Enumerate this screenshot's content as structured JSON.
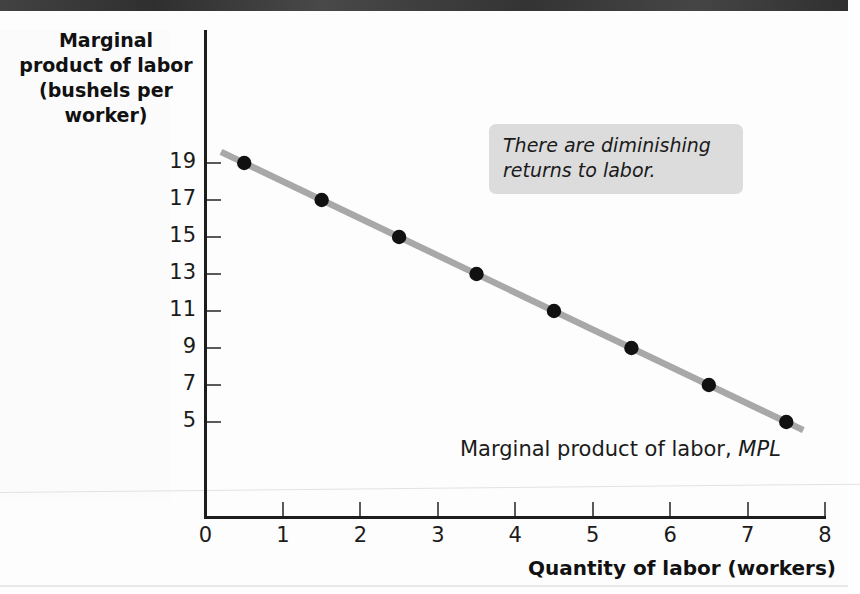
{
  "chart_data": {
    "type": "line",
    "title": "",
    "xlabel": "Quantity of labor (workers)",
    "ylabel": "Marginal product of labor (bushels per worker)",
    "ylabel_lines": [
      "Marginal",
      "product of labor",
      "(bushels per",
      "worker)"
    ],
    "xlim": [
      0,
      8
    ],
    "ylim": [
      4,
      20
    ],
    "grid": false,
    "legend": "none",
    "x_ticks": [
      "0",
      "1",
      "2",
      "3",
      "4",
      "5",
      "6",
      "7",
      "8"
    ],
    "y_ticks": [
      "19",
      "17",
      "15",
      "13",
      "11",
      "9",
      "7",
      "5"
    ],
    "series": [
      {
        "name": "Marginal product of labor, MPL",
        "x": [
          0.5,
          1.5,
          2.5,
          3.5,
          4.5,
          5.5,
          6.5,
          7.5
        ],
        "values": [
          19,
          17,
          15,
          13,
          11,
          9,
          7,
          5
        ],
        "line_color": "#a8a8a8",
        "marker_color": "#111111"
      }
    ],
    "annotations": [
      {
        "text": "There are diminishing returns to labor.",
        "style": "italic-callout-box"
      }
    ]
  },
  "axis": {
    "x_title": "Quantity of labor (workers)",
    "y_title_line_1": "Marginal",
    "y_title_line_2": "product of labor",
    "y_title_line_3": "(bushels per",
    "y_title_line_4": "worker)"
  },
  "annotation": {
    "line_1": "There are diminishing",
    "line_2": "returns to labor."
  },
  "series_label": {
    "prefix": "Marginal product of labor, ",
    "symbol": "MPL"
  },
  "colors": {
    "line": "#a8a8a8",
    "marker": "#111111",
    "axis": "#1d1d1d",
    "annotation_bg": "#dcdcdc",
    "top_bar": "#3b3b3b"
  }
}
